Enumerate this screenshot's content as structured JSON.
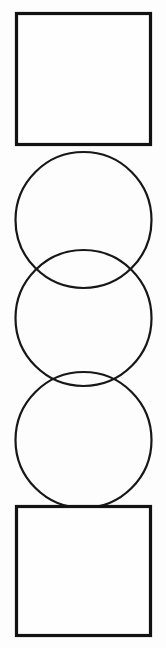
{
  "figure": {
    "canvas": {
      "width": 166,
      "height": 648,
      "background_color": "#fdfdfd"
    },
    "style": {
      "square_stroke_color": "#121212",
      "square_stroke_width": 3.2,
      "square_fill_color": "#fefefe",
      "circle_stroke_color": "#171717",
      "circle_stroke_width": 2.2,
      "circle_fill": "none"
    },
    "shapes": [
      {
        "name": "top-square",
        "type": "square",
        "x": 16.5,
        "y": 13.5,
        "width": 134,
        "height": 131
      },
      {
        "name": "circle-upper",
        "type": "circle",
        "cx": 83.5,
        "cy": 220,
        "r": 68
      },
      {
        "name": "circle-middle",
        "type": "circle",
        "cx": 83.5,
        "cy": 318,
        "r": 68
      },
      {
        "name": "circle-lower",
        "type": "circle",
        "cx": 83.5,
        "cy": 440,
        "r": 68
      },
      {
        "name": "bottom-square",
        "type": "square",
        "x": 16.5,
        "y": 506.5,
        "width": 134,
        "height": 129
      }
    ]
  }
}
